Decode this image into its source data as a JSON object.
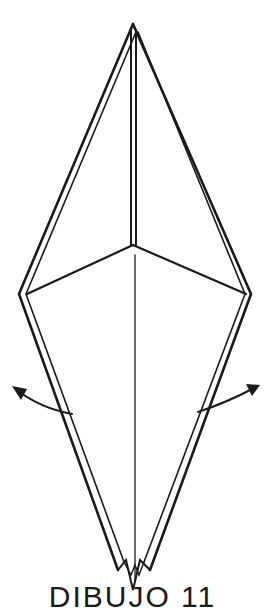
{
  "diagram": {
    "caption": "DIBUJO 11",
    "arrows": [
      {
        "direction": "left",
        "meaning": "open flap outward"
      },
      {
        "direction": "right",
        "meaning": "open flap outward"
      }
    ],
    "colors": {
      "line": "#1a1a1a",
      "background": "#ffffff"
    }
  }
}
